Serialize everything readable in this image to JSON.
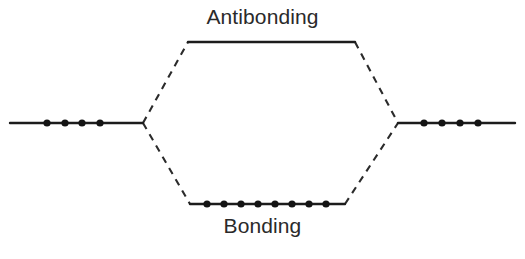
{
  "diagram": {
    "type": "molecular-orbital-energy-diagram",
    "background_color": "#ffffff",
    "line_color": "#1c1c1c",
    "dashed_color": "#2b2b2b",
    "electron_color": "#141414",
    "text_color": "#2a2a2a"
  },
  "labels": {
    "antibonding": "Antibonding",
    "bonding": "Bonding"
  },
  "levels": {
    "left_atomic": {
      "name": "left-atomic-level",
      "label": "",
      "x1": 10,
      "x2": 143,
      "y": 123,
      "electron_count": 4,
      "electron_x": [
        47,
        65,
        82,
        100
      ],
      "electron_y": 123
    },
    "right_atomic": {
      "name": "right-atomic-level",
      "label": "",
      "x1": 398,
      "x2": 515,
      "y": 123,
      "electron_count": 4,
      "electron_x": [
        424,
        442,
        460,
        478
      ],
      "electron_y": 123
    },
    "antibonding": {
      "name": "antibonding-level",
      "label": "Antibonding",
      "x1": 188,
      "x2": 355,
      "y": 42,
      "electron_count": 0,
      "electron_x": [],
      "electron_y": 42
    },
    "bonding": {
      "name": "bonding-level",
      "label": "Bonding",
      "x1": 190,
      "x2": 345,
      "y": 204,
      "electron_count": 8,
      "electron_x": [
        207,
        224,
        241,
        258,
        275,
        292,
        309,
        326
      ],
      "electron_y": 204
    }
  },
  "connectors": [
    {
      "name": "left-to-antibonding",
      "x1": 143,
      "y1": 123,
      "x2": 188,
      "y2": 42
    },
    {
      "name": "left-to-bonding",
      "x1": 143,
      "y1": 123,
      "x2": 190,
      "y2": 204
    },
    {
      "name": "antibonding-to-right",
      "x1": 355,
      "y1": 42,
      "x2": 398,
      "y2": 123
    },
    {
      "name": "bonding-to-right",
      "x1": 345,
      "y1": 204,
      "x2": 398,
      "y2": 123
    }
  ],
  "electron_dot_radius": 3.6
}
